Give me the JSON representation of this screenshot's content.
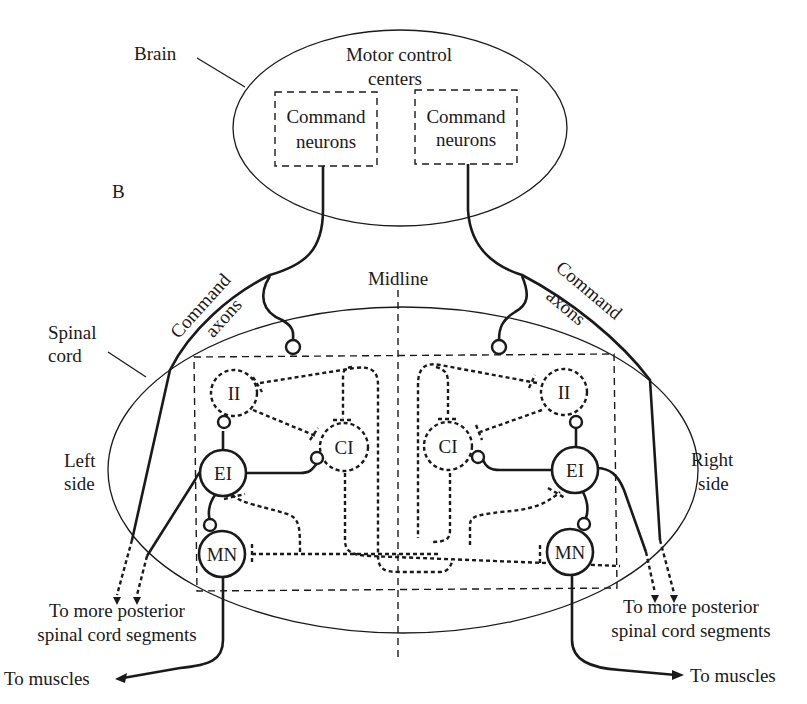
{
  "panel_label": "B",
  "labels": {
    "brain": "Brain",
    "motor_control_line1": "Motor control",
    "motor_control_line2": "centers",
    "command_neurons_left_line1": "Command",
    "command_neurons_left_line2": "neurons",
    "command_neurons_right_line1": "Command",
    "command_neurons_right_line2": "neurons",
    "midline": "Midline",
    "spinal_cord_line1": "Spinal",
    "spinal_cord_line2": "cord",
    "command_axons_left_line1": "Command",
    "command_axons_left_line2": "axons",
    "command_axons_right_line1": "Command",
    "command_axons_right_line2": "axons",
    "left_side_line1": "Left",
    "left_side_line2": "side",
    "right_side_line1": "Right",
    "right_side_line2": "side",
    "posterior_left_line1": "To more posterior",
    "posterior_left_line2": "spinal cord segments",
    "posterior_right_line1": "To more posterior",
    "posterior_right_line2": "spinal cord segments",
    "muscles_left": "To muscles",
    "muscles_right": "To muscles"
  },
  "neurons": {
    "left": {
      "ii": "II",
      "ci": "CI",
      "ei": "EI",
      "mn": "MN"
    },
    "right": {
      "ii": "II",
      "ci": "CI",
      "ei": "EI",
      "mn": "MN"
    }
  },
  "colors": {
    "ink": "#1a1a1a",
    "background": "#ffffff"
  }
}
